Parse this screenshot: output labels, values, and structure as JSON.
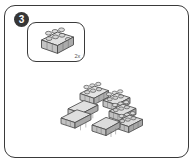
{
  "page": {
    "type": "lego-instruction-step",
    "background_color": "#ffffff",
    "frame_color": "#3a3a3a"
  },
  "step": {
    "number": "3",
    "badge_background": "#363636",
    "badge_text_color": "#ffffff"
  },
  "callout": {
    "label": "parts-callout",
    "quantity": "2x",
    "part": {
      "name": "brick-2x4",
      "studs": 8,
      "rows": 2,
      "columns": 4,
      "color": "#d9d9d9"
    }
  },
  "model": {
    "label": "assembly-view",
    "description": "Stepped arrow-shaped assembly of grey 2x4 bricks",
    "brick_color": "#d5d5d5",
    "brick_top_color": "#e4e4e4",
    "brick_side_color": "#b8b8b8",
    "outline_color": "#4a4a4a",
    "brick_count": 7
  }
}
